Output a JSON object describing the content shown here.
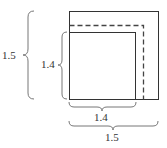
{
  "diagram": {
    "type": "nested-squares",
    "outer_square": {
      "side": "1.5"
    },
    "inner_square": {
      "side": "1.4"
    },
    "dashed_square": {
      "style": "dashed"
    },
    "labels": {
      "left_outer": "1.5",
      "left_inner": "1.4",
      "bottom_inner": "1.4",
      "bottom_outer": "1.5"
    },
    "colors": {
      "stroke": "#333333",
      "brace": "#777777",
      "background": "#ffffff"
    }
  }
}
